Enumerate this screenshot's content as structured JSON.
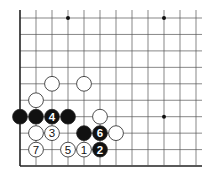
{
  "diagram": {
    "type": "go-board-fragment",
    "grid": {
      "columns": 12,
      "rows": 10,
      "origin_x": 20,
      "origin_y": 18,
      "spacing_x": 16,
      "spacing_y": 16.45,
      "right_extends": true,
      "top_extends": true,
      "edges": [
        "left",
        "bottom"
      ]
    },
    "colors": {
      "line": "#555555",
      "edge": "#222222",
      "black_stone": "#111111",
      "white_stone": "#ffffff",
      "stone_outline": "#222222"
    },
    "star_points": [
      {
        "col": 3,
        "row": 0
      },
      {
        "col": 9,
        "row": 0
      },
      {
        "col": 9,
        "row": 6
      }
    ],
    "stones": [
      {
        "color": "white",
        "col": 2,
        "row": 4,
        "label": ""
      },
      {
        "color": "white",
        "col": 4,
        "row": 4,
        "label": ""
      },
      {
        "color": "white",
        "col": 1,
        "row": 5,
        "label": ""
      },
      {
        "color": "black",
        "col": 0,
        "row": 6,
        "label": ""
      },
      {
        "color": "black",
        "col": 1,
        "row": 6,
        "label": ""
      },
      {
        "color": "black",
        "col": 2,
        "row": 6,
        "label": "4"
      },
      {
        "color": "black",
        "col": 3,
        "row": 6,
        "label": ""
      },
      {
        "color": "white",
        "col": 5,
        "row": 6,
        "label": ""
      },
      {
        "color": "white",
        "col": 1,
        "row": 7,
        "label": ""
      },
      {
        "color": "white",
        "col": 2,
        "row": 7,
        "label": "3"
      },
      {
        "color": "black",
        "col": 4,
        "row": 7,
        "label": ""
      },
      {
        "color": "black",
        "col": 5,
        "row": 7,
        "label": "6"
      },
      {
        "color": "white",
        "col": 6,
        "row": 7,
        "label": ""
      },
      {
        "color": "white",
        "col": 1,
        "row": 8,
        "label": "7"
      },
      {
        "color": "white",
        "col": 3,
        "row": 8,
        "label": "5"
      },
      {
        "color": "white",
        "col": 4,
        "row": 8,
        "label": "1"
      },
      {
        "color": "black",
        "col": 5,
        "row": 8,
        "label": "2"
      }
    ]
  }
}
